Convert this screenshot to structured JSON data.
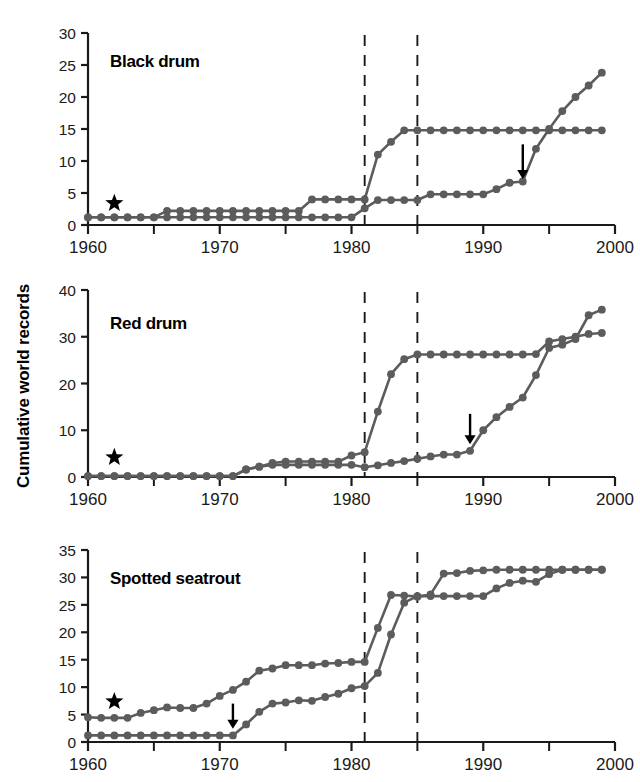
{
  "figure": {
    "ylabel": "Cumulative world records",
    "xlabel": "",
    "marker_color": "#5c5c5c",
    "line_color": "#5c5c5c",
    "axis_color": "#1a1a1a",
    "dashed_color": "#1a1a1a"
  },
  "chart_data": [
    {
      "type": "line",
      "title": "Black drum",
      "xlabel": "",
      "ylabel": "Cumulative world records",
      "xlim": [
        1960,
        2000
      ],
      "ylim": [
        0,
        30
      ],
      "xticks": [
        1960,
        1970,
        1980,
        1990,
        2000
      ],
      "xticklabels": [
        "1960",
        "1970",
        "1980",
        "1990",
        "2000"
      ],
      "xminorticks": [
        1965,
        1975,
        1985,
        1995
      ],
      "yticks": [
        0,
        5,
        10,
        15,
        20,
        25,
        30
      ],
      "yticklabels": [
        "0",
        "5",
        "10",
        "15",
        "20",
        "25",
        "30"
      ],
      "grid": false,
      "legend": "none",
      "annotations": [
        {
          "kind": "star",
          "x": 1962,
          "y": 3.4
        },
        {
          "kind": "arrow-down",
          "x": 1993,
          "y": 12.6,
          "tip_y": 7.2
        },
        {
          "kind": "dashed-vline",
          "x": 1981
        },
        {
          "kind": "dashed-vline",
          "x": 1985
        }
      ],
      "series": [
        {
          "name": "upper",
          "x": [
            1960,
            1961,
            1962,
            1963,
            1964,
            1965,
            1966,
            1967,
            1968,
            1969,
            1970,
            1971,
            1972,
            1973,
            1974,
            1975,
            1976,
            1977,
            1978,
            1979,
            1980,
            1981,
            1982,
            1983,
            1984,
            1985,
            1986,
            1987,
            1988,
            1989,
            1990,
            1991,
            1992,
            1993,
            1994,
            1995,
            1996,
            1997,
            1998,
            1999
          ],
          "y": [
            1.2,
            1.2,
            1.2,
            1.2,
            1.2,
            1.2,
            2.2,
            2.2,
            2.2,
            2.2,
            2.2,
            2.2,
            2.2,
            2.2,
            2.2,
            2.2,
            2.2,
            4.0,
            4.0,
            4.0,
            4.0,
            4.0,
            11.0,
            13.0,
            14.8,
            14.8,
            14.8,
            14.8,
            14.8,
            14.8,
            14.8,
            14.8,
            14.8,
            14.8,
            14.8,
            14.8,
            14.8,
            14.8,
            14.8,
            14.8
          ]
        },
        {
          "name": "lower",
          "x": [
            1960,
            1961,
            1962,
            1963,
            1964,
            1965,
            1966,
            1967,
            1968,
            1969,
            1970,
            1971,
            1972,
            1973,
            1974,
            1975,
            1976,
            1977,
            1978,
            1979,
            1980,
            1981,
            1982,
            1983,
            1984,
            1985,
            1986,
            1987,
            1988,
            1989,
            1990,
            1991,
            1992,
            1993,
            1994,
            1995,
            1996,
            1997,
            1998,
            1999
          ],
          "y": [
            1.2,
            1.2,
            1.2,
            1.2,
            1.2,
            1.2,
            1.2,
            1.2,
            1.2,
            1.2,
            1.2,
            1.2,
            1.2,
            1.2,
            1.2,
            1.2,
            1.2,
            1.2,
            1.2,
            1.2,
            1.2,
            2.6,
            3.9,
            3.9,
            3.9,
            3.9,
            4.8,
            4.8,
            4.8,
            4.8,
            4.8,
            5.6,
            6.6,
            6.8,
            11.9,
            15.0,
            17.8,
            20.0,
            21.8,
            23.8
          ]
        }
      ]
    },
    {
      "type": "line",
      "title": "Red drum",
      "xlabel": "",
      "ylabel": "Cumulative world records",
      "xlim": [
        1960,
        2000
      ],
      "ylim": [
        0,
        40
      ],
      "xticks": [
        1960,
        1970,
        1980,
        1990,
        2000
      ],
      "xticklabels": [
        "1960",
        "1970",
        "1980",
        "1990",
        "2000"
      ],
      "xminorticks": [
        1965,
        1975,
        1985,
        1995
      ],
      "yticks": [
        0,
        10,
        20,
        30,
        40
      ],
      "yticklabels": [
        "0",
        "10",
        "20",
        "30",
        "40"
      ],
      "grid": false,
      "legend": "none",
      "annotations": [
        {
          "kind": "star",
          "x": 1962,
          "y": 4.2
        },
        {
          "kind": "arrow-down",
          "x": 1989,
          "y": 13.5,
          "tip_y": 7.0
        },
        {
          "kind": "dashed-vline",
          "x": 1981
        },
        {
          "kind": "dashed-vline",
          "x": 1985
        }
      ],
      "series": [
        {
          "name": "upper",
          "x": [
            1960,
            1961,
            1962,
            1963,
            1964,
            1965,
            1966,
            1967,
            1968,
            1969,
            1970,
            1971,
            1972,
            1973,
            1974,
            1975,
            1976,
            1977,
            1978,
            1979,
            1980,
            1981,
            1982,
            1983,
            1984,
            1985,
            1986,
            1987,
            1988,
            1989,
            1990,
            1991,
            1992,
            1993,
            1994,
            1995,
            1996,
            1997,
            1998,
            1999
          ],
          "y": [
            0.2,
            0.2,
            0.2,
            0.2,
            0.2,
            0.2,
            0.2,
            0.2,
            0.2,
            0.2,
            0.2,
            0.2,
            1.6,
            2.2,
            3.0,
            3.3,
            3.3,
            3.3,
            3.3,
            3.3,
            4.6,
            5.3,
            14.0,
            22.0,
            25.2,
            26.2,
            26.2,
            26.2,
            26.2,
            26.2,
            26.2,
            26.2,
            26.2,
            26.2,
            26.3,
            29.0,
            29.5,
            30.0,
            30.6,
            30.8
          ]
        },
        {
          "name": "lower",
          "x": [
            1960,
            1961,
            1962,
            1963,
            1964,
            1965,
            1966,
            1967,
            1968,
            1969,
            1970,
            1971,
            1972,
            1973,
            1974,
            1975,
            1976,
            1977,
            1978,
            1979,
            1980,
            1981,
            1982,
            1983,
            1984,
            1985,
            1986,
            1987,
            1988,
            1989,
            1990,
            1991,
            1992,
            1993,
            1994,
            1995,
            1996,
            1997,
            1998,
            1999
          ],
          "y": [
            0.2,
            0.2,
            0.2,
            0.2,
            0.2,
            0.2,
            0.2,
            0.2,
            0.2,
            0.2,
            0.2,
            0.2,
            1.6,
            2.2,
            2.6,
            2.6,
            2.6,
            2.6,
            2.6,
            2.6,
            2.6,
            2.1,
            2.5,
            3.0,
            3.4,
            3.9,
            4.4,
            4.8,
            4.8,
            5.6,
            10.0,
            12.8,
            15.0,
            17.0,
            21.8,
            27.6,
            28.3,
            29.5,
            34.6,
            35.8
          ]
        }
      ]
    },
    {
      "type": "line",
      "title": "Spotted seatrout",
      "xlabel": "",
      "ylabel": "Cumulative world records",
      "xlim": [
        1960,
        2000
      ],
      "ylim": [
        0,
        35
      ],
      "xticks": [
        1960,
        1970,
        1980,
        1990,
        2000
      ],
      "xticklabels": [
        "1960",
        "1970",
        "1980",
        "1990",
        "2000"
      ],
      "xminorticks": [
        1965,
        1975,
        1985,
        1995
      ],
      "yticks": [
        0,
        5,
        10,
        15,
        20,
        25,
        30,
        35
      ],
      "yticklabels": [
        "0",
        "5",
        "10",
        "15",
        "20",
        "25",
        "30",
        "35"
      ],
      "grid": false,
      "legend": "none",
      "annotations": [
        {
          "kind": "star",
          "x": 1962,
          "y": 7.4
        },
        {
          "kind": "arrow-down",
          "x": 1971,
          "y": 7.0,
          "tip_y": 2.4
        },
        {
          "kind": "dashed-vline",
          "x": 1981
        },
        {
          "kind": "dashed-vline",
          "x": 1985
        }
      ],
      "series": [
        {
          "name": "upper",
          "x": [
            1960,
            1961,
            1962,
            1963,
            1964,
            1965,
            1966,
            1967,
            1968,
            1969,
            1970,
            1971,
            1972,
            1973,
            1974,
            1975,
            1976,
            1977,
            1978,
            1979,
            1980,
            1981,
            1982,
            1983,
            1984,
            1985,
            1986,
            1987,
            1988,
            1989,
            1990,
            1991,
            1992,
            1993,
            1994,
            1995,
            1996,
            1997,
            1998,
            1999
          ],
          "y": [
            4.5,
            4.4,
            4.4,
            4.4,
            5.3,
            5.8,
            6.3,
            6.2,
            6.2,
            7.0,
            8.4,
            9.5,
            11.0,
            13.0,
            13.4,
            14.0,
            14.0,
            14.0,
            14.3,
            14.4,
            14.6,
            14.6,
            20.8,
            26.8,
            26.7,
            26.5,
            26.9,
            30.7,
            30.8,
            31.2,
            31.3,
            31.4,
            31.4,
            31.4,
            31.4,
            31.4,
            31.4,
            31.4,
            31.4,
            31.4
          ]
        },
        {
          "name": "lower",
          "x": [
            1960,
            1961,
            1962,
            1963,
            1964,
            1965,
            1966,
            1967,
            1968,
            1969,
            1970,
            1971,
            1972,
            1973,
            1974,
            1975,
            1976,
            1977,
            1978,
            1979,
            1980,
            1981,
            1982,
            1983,
            1984,
            1985,
            1986,
            1987,
            1988,
            1989,
            1990,
            1991,
            1992,
            1993,
            1994,
            1995,
            1996,
            1997,
            1998,
            1999
          ],
          "y": [
            1.2,
            1.2,
            1.2,
            1.2,
            1.2,
            1.2,
            1.2,
            1.2,
            1.2,
            1.2,
            1.2,
            1.2,
            3.2,
            5.5,
            7.0,
            7.2,
            7.6,
            7.5,
            8.2,
            8.8,
            9.8,
            10.2,
            12.6,
            19.6,
            25.4,
            26.6,
            26.6,
            26.6,
            26.6,
            26.6,
            26.6,
            28.0,
            29.0,
            29.4,
            29.2,
            30.6,
            31.4,
            31.4,
            31.4,
            31.4
          ]
        }
      ]
    }
  ]
}
